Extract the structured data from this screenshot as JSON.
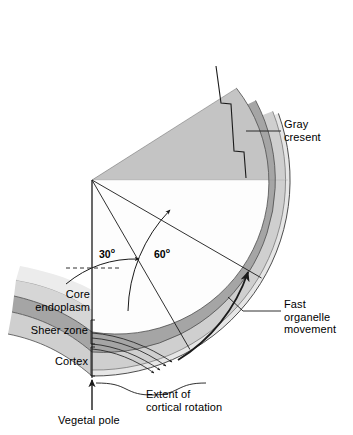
{
  "figure": {
    "kind": "cross-section-diagram"
  },
  "labels": {
    "gray_crescent": "Gray\ncresent",
    "fast_organelle": "Fast\norganelle\nmovement",
    "core_endoplasm": "Core\nendoplasm",
    "sheer_zone": "Sheer zone",
    "cortex": "Cortex",
    "extent": "Extent of\ncortical rotation",
    "vegetal_pole": "Vegetal pole"
  },
  "angles": {
    "inner": "30",
    "outer": "60",
    "degree_mark": "o"
  },
  "colors": {
    "core_endoplasm": "#d9d9d9",
    "core_endoplasm_upper": "#bdbdbd",
    "sheer_zone": "#a8a8a8",
    "sheer_zone_upper": "#9a9a9a",
    "cortex": "#cfcfcf",
    "outer_rim": "#e2e2e2",
    "white_field": "#fdfdfd",
    "stroke": "#1a1a1a",
    "dot": "#1a1a1a"
  },
  "geometry": {
    "apex_x": 92,
    "apex_y": 180,
    "wedge_start_deg": 90,
    "wedge_end_deg": -18,
    "radius_core_outer": 152,
    "radius_sheer_outer": 172,
    "radius_cortex_outer": 190,
    "radius_membrane": 196
  }
}
